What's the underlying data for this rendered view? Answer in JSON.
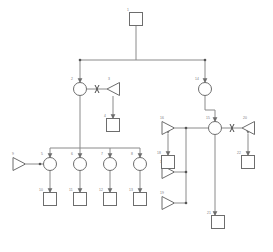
{
  "diagram": {
    "type": "pedigree-chart",
    "title": "",
    "colors": {
      "stroke": "#6d6d6d",
      "line": "#8a8a8a",
      "label": "#7a7a7a",
      "background": "#ffffff"
    },
    "generations": 4,
    "individual_count": 22
  },
  "individuals": [
    {
      "id": "1",
      "label": "1",
      "shape": "square",
      "cx": 136,
      "cy": 19,
      "size": 13,
      "generation": 1
    },
    {
      "id": "2",
      "label": "2",
      "shape": "circle",
      "cx": 80,
      "cy": 89,
      "size": 13,
      "generation": 2
    },
    {
      "id": "3",
      "label": "3",
      "shape": "triangle",
      "cx": 113,
      "cy": 89,
      "size": 13,
      "generation": 2
    },
    {
      "id": "4",
      "label": "4",
      "shape": "square",
      "cx": 113,
      "cy": 125,
      "size": 13,
      "generation": 3
    },
    {
      "id": "5",
      "label": "5",
      "shape": "circle",
      "cx": 50,
      "cy": 164,
      "size": 13,
      "generation": 3
    },
    {
      "id": "6",
      "label": "6",
      "shape": "circle",
      "cx": 80,
      "cy": 164,
      "size": 13,
      "generation": 3
    },
    {
      "id": "7",
      "label": "7",
      "shape": "circle",
      "cx": 110,
      "cy": 164,
      "size": 13,
      "generation": 3
    },
    {
      "id": "8",
      "label": "8",
      "shape": "circle",
      "cx": 140,
      "cy": 164,
      "size": 13,
      "generation": 3
    },
    {
      "id": "9",
      "label": "9",
      "shape": "triangle",
      "cx": 19,
      "cy": 160,
      "size": 13,
      "generation": 3
    },
    {
      "id": "10",
      "label": "10",
      "shape": "square",
      "cx": 50,
      "cy": 199,
      "size": 13,
      "generation": 4
    },
    {
      "id": "11",
      "label": "11",
      "shape": "square",
      "cx": 80,
      "cy": 199,
      "size": 13,
      "generation": 4
    },
    {
      "id": "12",
      "label": "12",
      "shape": "square",
      "cx": 110,
      "cy": 199,
      "size": 13,
      "generation": 4
    },
    {
      "id": "13",
      "label": "13",
      "shape": "square",
      "cx": 140,
      "cy": 199,
      "size": 13,
      "generation": 4
    },
    {
      "id": "14",
      "label": "14",
      "shape": "circle",
      "cx": 205,
      "cy": 89,
      "size": 13,
      "generation": 2
    },
    {
      "id": "15",
      "label": "15",
      "shape": "circle",
      "cx": 215,
      "cy": 128,
      "size": 13,
      "generation": 3
    },
    {
      "id": "16",
      "label": "16",
      "shape": "triangle",
      "cx": 168,
      "cy": 128,
      "size": 13,
      "generation": 3
    },
    {
      "id": "17",
      "label": "17",
      "shape": "triangle",
      "cx": 168,
      "cy": 172,
      "size": 13,
      "generation": 3
    },
    {
      "id": "18",
      "label": "18",
      "shape": "square",
      "cx": 168,
      "cy": 162,
      "size": 13,
      "generation": 4
    },
    {
      "id": "19",
      "label": "19",
      "shape": "triangle",
      "cx": 168,
      "cy": 203,
      "size": 13,
      "generation": 3
    },
    {
      "id": "20",
      "label": "20",
      "shape": "triangle",
      "cx": 248,
      "cy": 128,
      "size": 13,
      "generation": 3
    },
    {
      "id": "21",
      "label": "21",
      "shape": "square",
      "cx": 218,
      "cy": 222,
      "size": 13,
      "generation": 4
    },
    {
      "id": "22",
      "label": "22",
      "shape": "square",
      "cx": 248,
      "cy": 162,
      "size": 13,
      "generation": 4
    }
  ],
  "relationships": [
    {
      "from": "2",
      "to": "3",
      "kind": "partner-severed"
    },
    {
      "from": "15",
      "to": "20",
      "kind": "partner-severed"
    },
    {
      "from": "9",
      "to": "5",
      "kind": "partner"
    },
    {
      "from": "16",
      "to": "15",
      "kind": "partner"
    },
    {
      "from": "17",
      "to": "15",
      "kind": "partner"
    },
    {
      "from": "19",
      "to": "15",
      "kind": "partner"
    },
    {
      "from": "1",
      "to": "2",
      "kind": "descent"
    },
    {
      "from": "1",
      "to": "14",
      "kind": "descent"
    },
    {
      "from": "3",
      "to": "4",
      "kind": "descent"
    },
    {
      "from": "2",
      "to": "5",
      "kind": "descent"
    },
    {
      "from": "2",
      "to": "6",
      "kind": "descent"
    },
    {
      "from": "2",
      "to": "7",
      "kind": "descent"
    },
    {
      "from": "2",
      "to": "8",
      "kind": "descent"
    },
    {
      "from": "5",
      "to": "10",
      "kind": "descent"
    },
    {
      "from": "6",
      "to": "11",
      "kind": "descent"
    },
    {
      "from": "7",
      "to": "12",
      "kind": "descent"
    },
    {
      "from": "8",
      "to": "13",
      "kind": "descent"
    },
    {
      "from": "14",
      "to": "15",
      "kind": "descent"
    },
    {
      "from": "16",
      "to": "18",
      "kind": "descent"
    },
    {
      "from": "20",
      "to": "22",
      "kind": "descent"
    },
    {
      "from": "15",
      "to": "21",
      "kind": "descent"
    }
  ]
}
